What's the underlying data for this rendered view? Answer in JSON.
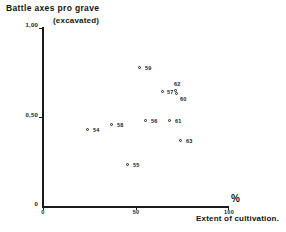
{
  "chart_data": {
    "type": "scatter",
    "title": "Battle axes pro grave",
    "subtitle": "(excavated)",
    "xlabel": "Extent of cultivation.",
    "ylabel": "",
    "x_unit_symbol": "%",
    "xlim": [
      0,
      100
    ],
    "ylim": [
      0,
      1.0
    ],
    "grid": false,
    "legend": "none",
    "x_ticks": [
      {
        "value": 0,
        "label": "0"
      },
      {
        "value": 50,
        "label": "50"
      },
      {
        "value": 100,
        "label": "100"
      }
    ],
    "y_ticks": [
      {
        "value": 0,
        "label": "0"
      },
      {
        "value": 0.5,
        "label": "0,50"
      },
      {
        "value": 1.0,
        "label": "1,00"
      }
    ],
    "points": [
      {
        "label": "54",
        "x": 24,
        "y": 0.43,
        "px": 88,
        "py": 130,
        "lx": 93,
        "ly": 127
      },
      {
        "label": "58",
        "x": 38,
        "y": 0.455,
        "px": 112,
        "py": 125,
        "lx": 117,
        "ly": 122
      },
      {
        "label": "55",
        "x": 46,
        "y": 0.23,
        "px": 128,
        "py": 165,
        "lx": 133,
        "ly": 162
      },
      {
        "label": "59",
        "x": 52,
        "y": 0.775,
        "px": 140,
        "py": 68,
        "lx": 145,
        "ly": 65
      },
      {
        "label": "56",
        "x": 55,
        "y": 0.47,
        "px": 146,
        "py": 121,
        "lx": 151,
        "ly": 118
      },
      {
        "label": "57",
        "x": 65,
        "y": 0.64,
        "px": 163,
        "py": 92,
        "lx": 167,
        "ly": 89
      },
      {
        "label": "62",
        "x": 71,
        "y": 0.645,
        "px": 176,
        "py": 91,
        "lx": 174,
        "ly": 81
      },
      {
        "label": "60",
        "x": 72,
        "y": 0.625,
        "px": 177,
        "py": 94,
        "lx": 180,
        "ly": 96
      },
      {
        "label": "61",
        "x": 69,
        "y": 0.47,
        "px": 170,
        "py": 121,
        "lx": 175,
        "ly": 118
      },
      {
        "label": "63",
        "x": 75,
        "y": 0.365,
        "px": 181,
        "py": 141,
        "lx": 186,
        "ly": 138
      }
    ]
  },
  "colors": {
    "ink": "#1a1a1a",
    "background": "#ffffff"
  }
}
